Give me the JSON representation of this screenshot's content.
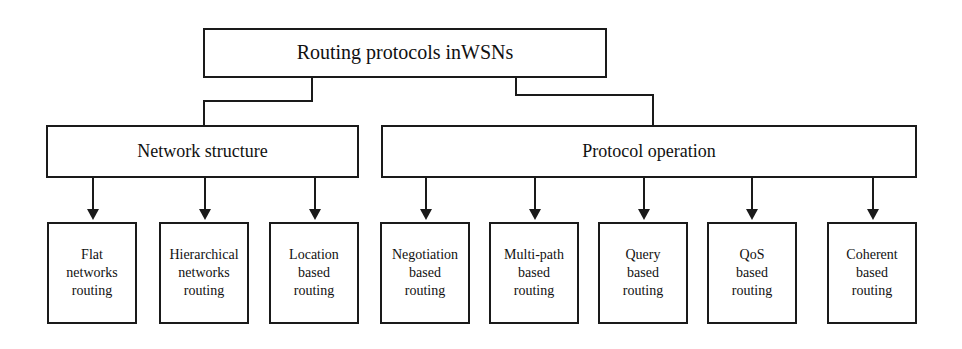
{
  "diagram": {
    "type": "hierarchy-tree",
    "title": "Routing protocols inWSNs",
    "root": {
      "id": "root",
      "label": "Routing protocols inWSNs"
    },
    "level2": [
      {
        "id": "network-structure",
        "label": "Network structure"
      },
      {
        "id": "protocol-operation",
        "label": "Protocol operation"
      }
    ],
    "leaves_network_structure": [
      {
        "id": "flat-networks-routing",
        "line1": "Flat",
        "line2": "networks",
        "line3": "routing",
        "label": "Flat networks routing"
      },
      {
        "id": "hierarchical-networks-routing",
        "line1": "Hierarchical",
        "line2": "networks",
        "line3": "routing",
        "label": "Hierarchical networks routing"
      },
      {
        "id": "location-based-routing",
        "line1": "Location",
        "line2": "based",
        "line3": "routing",
        "label": "Location based routing"
      }
    ],
    "leaves_protocol_operation": [
      {
        "id": "negotiation-based-routing",
        "line1": "Negotiation",
        "line2": "based",
        "line3": "routing",
        "label": "Negotiation based routing"
      },
      {
        "id": "multi-path-based-routing",
        "line1": "Multi-path",
        "line2": "based",
        "line3": "routing",
        "label": "Multi-path based routing"
      },
      {
        "id": "query-based-routing",
        "line1": "Query",
        "line2": "based",
        "line3": "routing",
        "label": "Query based routing"
      },
      {
        "id": "qos-based-routing",
        "line1": "QoS",
        "line2": "based",
        "line3": "routing",
        "label": "QoS based routing"
      },
      {
        "id": "coherent-based-routing",
        "line1": "Coherent",
        "line2": "based",
        "line3": "routing",
        "label": "Coherent based routing"
      }
    ],
    "colors": {
      "stroke": "#1a1a1a",
      "fill": "#ffffff",
      "text": "#111111"
    }
  }
}
